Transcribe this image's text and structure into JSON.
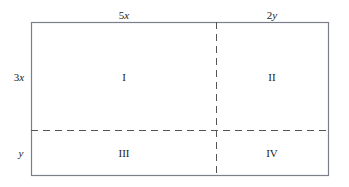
{
  "diagram": {
    "type": "area-model-rectangle",
    "top_labels": [
      {
        "text": "5",
        "var": "x"
      },
      {
        "text": "2",
        "var": "y"
      }
    ],
    "side_labels": [
      {
        "text": "3",
        "var": "x"
      },
      {
        "text": "",
        "var": "y"
      }
    ],
    "regions": [
      "I",
      "II",
      "III",
      "IV"
    ],
    "colors": {
      "border": "#7a7f8a",
      "dash": "#555555",
      "text": "#222222"
    }
  }
}
